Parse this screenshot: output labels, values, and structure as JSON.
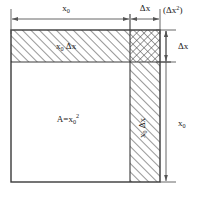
{
  "figure": {
    "name": "area-differential-square-diagram",
    "type": "geometric-diagram",
    "description_label": "Square of side x0 enlarged by delta x showing area increment decomposition"
  },
  "labels": {
    "top_width": "x",
    "top_width_sub": "0",
    "top_delta": "Δx",
    "top_corner_note_open": "(Δx",
    "top_corner_note_sup": "2",
    "top_corner_note_close": ")",
    "right_delta": "Δx",
    "right_height": "x",
    "right_height_sub": "0",
    "top_band": "x",
    "top_band_sub": "0",
    "top_band_delta": "Δx",
    "side_strip": "x",
    "side_strip_sub": "0",
    "side_strip_delta": "Δx",
    "main_area": "A=x",
    "main_area_sub": "0",
    "main_area_sup": "2"
  },
  "colors": {
    "stroke": "#3a3a3a",
    "hatch": "#4a4a4a",
    "text": "#1a1a1a",
    "background": "#ffffff",
    "dim_line": "#555555"
  },
  "geometry": {
    "left": 11,
    "divider_x": 130,
    "right": 160,
    "top": 30,
    "divider_y": 62,
    "bottom": 182,
    "top_dim_y": 14,
    "right_dim_x": 171,
    "x0_width": 119,
    "delta_x": 30
  },
  "regions": [
    {
      "name": "main-square",
      "label": "A=x0^2",
      "fill": "none"
    },
    {
      "name": "top-band",
      "label": "x0 Δx",
      "fill": "hatch-right"
    },
    {
      "name": "side-strip",
      "label": "x0 Δx",
      "fill": "hatch-right"
    },
    {
      "name": "corner-square",
      "label": "(Δx)^2",
      "fill": "cross-hatch"
    }
  ]
}
